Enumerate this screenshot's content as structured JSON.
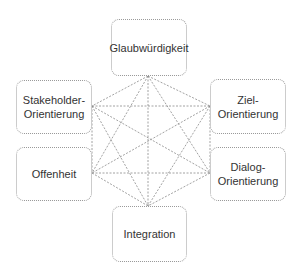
{
  "diagram": {
    "type": "complete-graph-hexagon",
    "line_style": "dotted",
    "line_color": "#8a8a8a",
    "box_border_color": "#9a9a9a",
    "text_color": "#333333",
    "nodes": [
      {
        "id": "glaubwuerdigkeit",
        "label": "Glaubwürdigkeit",
        "position": "top"
      },
      {
        "id": "stakeholder-orientierung",
        "label": "Stakeholder-\nOrientierung",
        "position": "upper-left"
      },
      {
        "id": "ziel-orientierung",
        "label": "Ziel-\nOrientierung",
        "position": "upper-right"
      },
      {
        "id": "offenheit",
        "label": "Offenheit",
        "position": "lower-left"
      },
      {
        "id": "dialog-orientierung",
        "label": "Dialog-\nOrientierung",
        "position": "lower-right"
      },
      {
        "id": "integration",
        "label": "Integration",
        "position": "bottom"
      }
    ],
    "edges": "all node pairs connected (15 edges)"
  }
}
